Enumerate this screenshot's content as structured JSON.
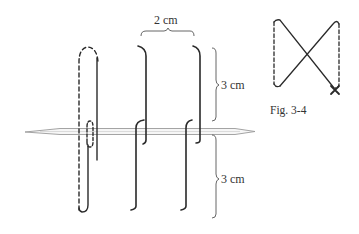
{
  "diagram": {
    "type": "stitch-instruction",
    "labels": {
      "width_dimension": "2 cm",
      "upper_height_dimension": "3 cm",
      "lower_height_dimension": "3 cm",
      "figure_caption": "Fig. 3-4"
    },
    "colors": {
      "thread": "#2a2a2a",
      "needle": "#9a9a9a",
      "text": "#333333"
    },
    "elements": [
      {
        "id": "needle",
        "description": "horizontal needle passing through stitches, pointed at left and right"
      },
      {
        "id": "stitch-1",
        "description": "long loop, front solid, back dashed, with small loop at needle"
      },
      {
        "id": "stitch-2",
        "description": "upper hook on needle and long lower hook"
      },
      {
        "id": "stitch-3",
        "description": "upper hook on needle and long lower hook"
      },
      {
        "id": "fig-3-4",
        "description": "figure-eight cross stitch with dashed verticals and an x at bottom right"
      }
    ]
  }
}
